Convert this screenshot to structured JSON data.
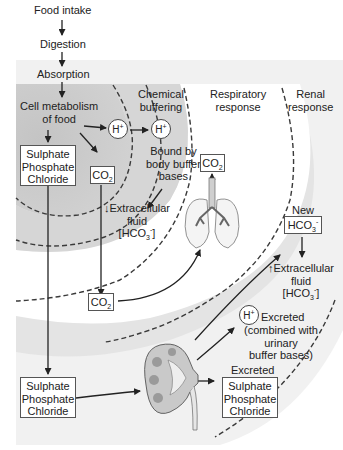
{
  "diagram": {
    "flow": {
      "food_intake": "Food intake",
      "digestion": "Digestion",
      "absorption": "Absorption",
      "cell_metabolism_line1": "Cell metabolism",
      "cell_metabolism_line2": "of food"
    },
    "zones": {
      "chemical_buffering": {
        "line1": "Chemical",
        "line2": "buffering"
      },
      "respiratory_response": {
        "line1": "Respiratory",
        "line2": "response"
      },
      "renal_response": {
        "line1": "Renal",
        "line2": "response"
      }
    },
    "ions": {
      "h_plus": "H",
      "h_plus_sup": "+"
    },
    "boxes": {
      "anions_top": [
        "Sulphate",
        "Phosphate",
        "Chloride"
      ],
      "co2_top": "CO",
      "co2_sub": "2",
      "co2_resp": "CO",
      "co2_mid": "CO",
      "new_hco3_label": "New",
      "hco3": "HCO",
      "hco3_sub": "3",
      "hco3_sup": "-",
      "anions_bottom": [
        "Sulphate",
        "Phosphate",
        "Chloride"
      ],
      "anions_excreted_label": "Excreted",
      "anions_excreted": [
        "Sulphate",
        "Phosphate",
        "Chloride"
      ]
    },
    "labels": {
      "bound_by": [
        "Bound by",
        "body buffer",
        "bases"
      ],
      "ecf_down_arrow": "↓",
      "ecf_up_arrow": "↑",
      "ecf_line1": "Extracellular",
      "ecf_line2": "fluid",
      "ecf_line3_open": "[HCO",
      "ecf_line3_sub": "3",
      "ecf_line3_sup": "-",
      "ecf_line3_close": "]",
      "h_excreted": [
        "Excreted",
        "(combined with",
        "urinary",
        "buffer bases)"
      ]
    },
    "colors": {
      "shade_inner": "#d2d2d2",
      "shade_outer": "#e6e6e6",
      "shade_renal": "#eeeeee",
      "line": "#2a2a2a",
      "dash": "#3a3a3a",
      "organ_fill": "#bdbdbd",
      "organ_dark": "#7a7a7a"
    }
  }
}
